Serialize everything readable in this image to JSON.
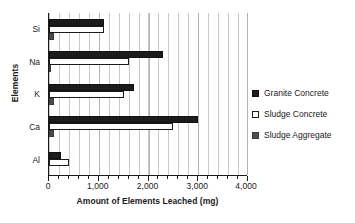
{
  "chart_data": {
    "type": "bar",
    "orientation": "horizontal",
    "title": "",
    "xlabel": "Amount of Elements Leached (mg)",
    "ylabel": "Elements",
    "categories": [
      "Si",
      "Na",
      "K",
      "Ca",
      "Al"
    ],
    "xlim": [
      0,
      4000
    ],
    "xticks": [
      0,
      1000,
      2000,
      3000,
      4000
    ],
    "xtick_labels": [
      "0",
      "1,000",
      "2,000",
      "3,000",
      "4,000"
    ],
    "minor_tick_step": 200,
    "grid": "vertical",
    "legend_position": "right",
    "series": [
      {
        "name": "Granite Concrete",
        "color": "#1c1c1c",
        "values": [
          1100,
          2300,
          1700,
          3000,
          250
        ]
      },
      {
        "name": "Sludge Concrete",
        "color": "#ffffff",
        "values": [
          1100,
          1600,
          1500,
          2500,
          400
        ]
      },
      {
        "name": "Sludge Aggregate",
        "color": "#4d4d4d",
        "values": [
          100,
          40,
          110,
          100,
          0
        ]
      }
    ]
  },
  "legend": {
    "items": [
      {
        "label": "Granite Concrete",
        "swatch": "filled-black-square-icon"
      },
      {
        "label": "Sludge Concrete",
        "swatch": "outlined-white-square-icon"
      },
      {
        "label": "Sludge Aggregate",
        "swatch": "filled-gray-square-icon"
      }
    ]
  }
}
